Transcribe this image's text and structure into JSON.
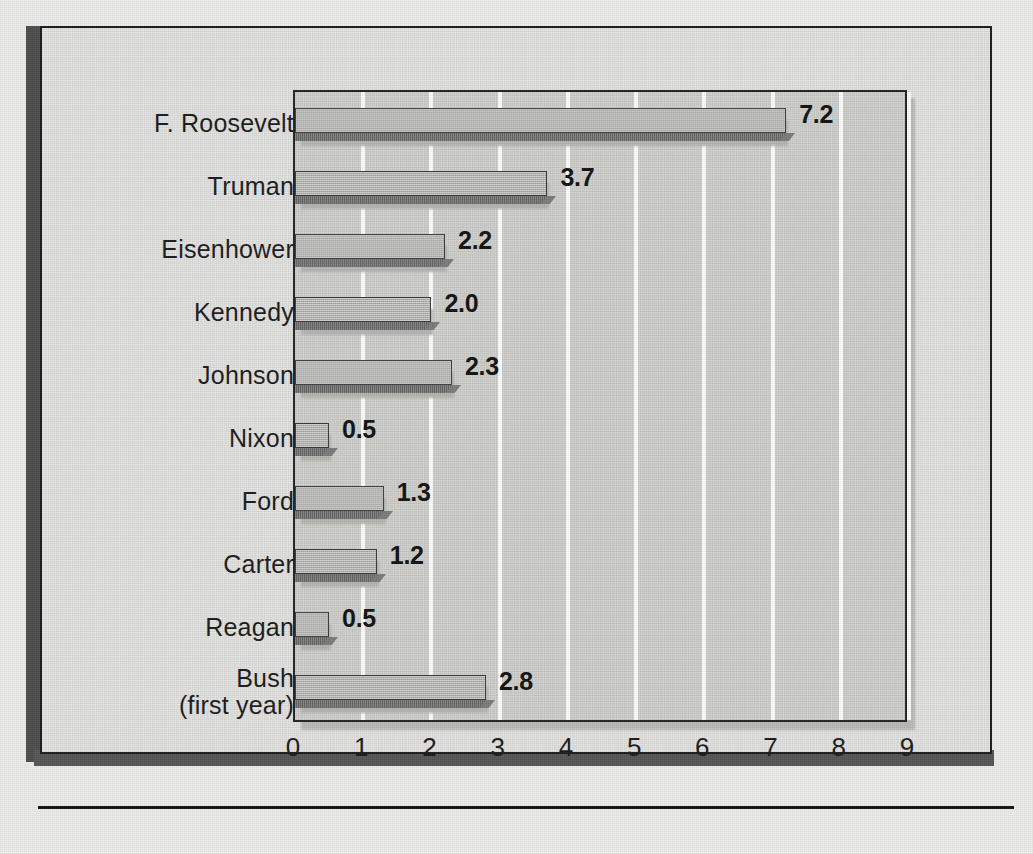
{
  "chart_data": {
    "type": "bar",
    "orientation": "horizontal",
    "title": "",
    "xlabel": "",
    "ylabel": "",
    "xlim": [
      0,
      9
    ],
    "xticks": [
      "0",
      "1",
      "2",
      "3",
      "4",
      "5",
      "6",
      "7",
      "8",
      "9"
    ],
    "grid": true,
    "gridline_color": "#fdfdfb",
    "legend": "none",
    "categories": [
      "F. Roosevelt",
      "Truman",
      "Eisenhower",
      "Kennedy",
      "Johnson",
      "Nixon",
      "Ford",
      "Carter",
      "Reagan",
      "Bush\n(first year)"
    ],
    "values": [
      7.2,
      3.7,
      2.2,
      2.0,
      2.3,
      0.5,
      1.3,
      1.2,
      0.5,
      2.8
    ],
    "value_labels": [
      "7.2",
      "3.7",
      "2.2",
      "2.0",
      "2.3",
      "0.5",
      "1.3",
      "1.2",
      "0.5",
      "2.8"
    ]
  },
  "style": {
    "page_background": "#ececea",
    "frame_background": "#e2e2e0",
    "plot_background": "#cfcfcc",
    "bar_top_color": "#b3b3b0",
    "bar_face_color": "#6f6f6f",
    "text_color": "#1a1a1a",
    "frame_edge_color": "#4d4d4d"
  }
}
